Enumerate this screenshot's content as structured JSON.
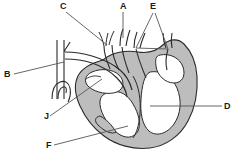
{
  "figure": {
    "kind": "anatomical-diagram",
    "background_color": "#ffffff",
    "outline_color": "#2b2b2b",
    "muscle_fill_color": "#bdbdbd",
    "chamber_fill_color": "#ffffff",
    "vessel_fill_color": "#e8e8e8",
    "leader_line_color": "#555555",
    "label_color": "#1a1a1a"
  },
  "labels": [
    {
      "id": "C",
      "text": "C",
      "x": 60,
      "y": 2
    },
    {
      "id": "A",
      "text": "A",
      "x": 120,
      "y": 2
    },
    {
      "id": "E",
      "text": "E",
      "x": 150,
      "y": 2
    },
    {
      "id": "B",
      "text": "B",
      "x": 4,
      "y": 70
    },
    {
      "id": "D",
      "text": "D",
      "x": 224,
      "y": 102
    },
    {
      "id": "J",
      "text": "J",
      "x": 44,
      "y": 116
    },
    {
      "id": "F",
      "text": "F",
      "x": 46,
      "y": 141
    }
  ],
  "leaders": [
    {
      "for": "C",
      "points": "66,12 107,45"
    },
    {
      "for": "A",
      "points": "123,12 123,38"
    },
    {
      "for": "E",
      "points": "153,12 135,47"
    },
    {
      "for": "E2",
      "points": "155,12 168,48"
    },
    {
      "for": "B",
      "points": "14,74 64,61"
    },
    {
      "for": "D",
      "points": "222,106 150,106"
    },
    {
      "for": "J",
      "points": "50,115 102,79"
    },
    {
      "for": "F",
      "points": "54,145 128,126"
    }
  ]
}
